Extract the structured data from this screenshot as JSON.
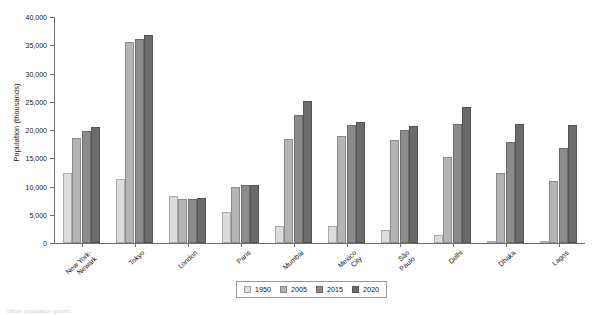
{
  "chart_data": {
    "type": "bar",
    "title": "",
    "xlabel": "",
    "ylabel": "Population (thousands)",
    "ylim": [
      0,
      40000
    ],
    "ytick_labels": [
      "40,000",
      "35,000",
      "30,000",
      "25,000",
      "20,000",
      "15,000",
      "10,000",
      "5,000",
      "0"
    ],
    "ytick_values": [
      40000,
      35000,
      30000,
      25000,
      20000,
      15000,
      10000,
      5000,
      0
    ],
    "grid": false,
    "legend_position": "bottom-center",
    "categories": [
      "New York-\nNewark",
      "Tokyo",
      "London",
      "Paris",
      "Mumbai",
      "Mexico\nCity",
      "São\nPaulo",
      "Delhi",
      "Dhaka",
      "Lagos"
    ],
    "series": [
      {
        "name": "1950",
        "color": "#dcdcdc",
        "values": [
          12340,
          11275,
          8360,
          5420,
          2980,
          3030,
          2330,
          1370,
          340,
          330
        ]
      },
      {
        "name": "2005",
        "color": "#b4b4b4",
        "values": [
          18650,
          35620,
          7830,
          9910,
          18400,
          19010,
          18320,
          15270,
          12480,
          10990
        ]
      },
      {
        "name": "2015",
        "color": "#8b8b8b",
        "values": [
          19900,
          36030,
          7870,
          10200,
          22630,
          20840,
          20020,
          21020,
          17900,
          16780
        ]
      },
      {
        "name": "2020",
        "color": "#6b6b6b",
        "values": [
          20600,
          36770,
          7980,
          10340,
          25090,
          21460,
          20660,
          24110,
          21100,
          20800
        ]
      }
    ]
  },
  "footnote": "Urban population growth"
}
